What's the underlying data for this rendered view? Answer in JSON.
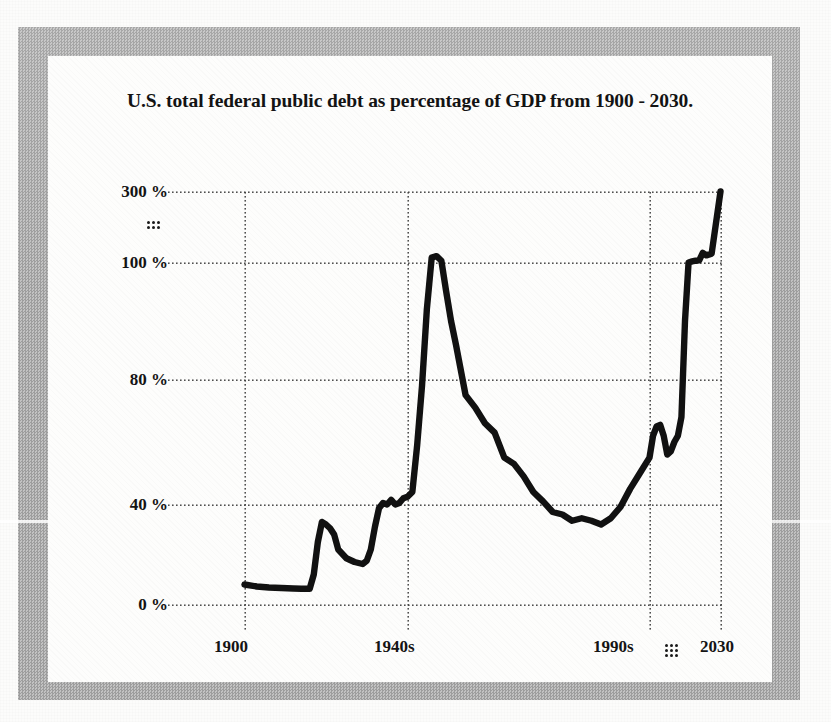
{
  "figure": {
    "title": "U.S. total federal public debt as percentage of GDP from 1900 - 2030.",
    "frame_color": "#a8a8a8",
    "panel_color": "#fdfdfc",
    "line_color": "#111111",
    "grid_color": "#4a4a4a"
  },
  "axes": {
    "y_ticks": [
      "300 %",
      "100 %",
      "80 %",
      "40 %",
      "0 %"
    ],
    "y_break_marker": "vertical-ellipsis-dots",
    "x_ticks": [
      "1900",
      "1940s",
      "1990s",
      "2030"
    ],
    "x_break_marker": "vertical-ellipsis-dots",
    "y_axis_note": "broken axis between 100 % and 300 %",
    "x_axis_note": "broken axis between 1990s and 2030"
  },
  "chart_data": {
    "type": "line",
    "title": "U.S. total federal public debt as percentage of GDP from 1900 - 2030.",
    "xlabel": "",
    "ylabel": "",
    "grid": true,
    "legend": null,
    "xlim": [
      1900,
      2030
    ],
    "ylim": [
      0,
      300
    ],
    "y_tick_values": [
      0,
      40,
      80,
      100,
      300
    ],
    "y_tick_labels": [
      "0 %",
      "40 %",
      "80 %",
      "100 %",
      "300 %"
    ],
    "x_tick_values": [
      1900,
      1940,
      1990,
      2030
    ],
    "x_tick_labels": [
      "1900",
      "1940s",
      "1990s",
      "2030"
    ],
    "axis_breaks": {
      "y_between": [
        100,
        300
      ],
      "x_between": [
        1990,
        2030
      ]
    },
    "series": [
      {
        "name": "Federal public debt (% of GDP)",
        "x": [
          1900,
          1903,
          1906,
          1909,
          1912,
          1914,
          1916,
          1917,
          1918,
          1919,
          1920,
          1921,
          1922,
          1923,
          1925,
          1927,
          1929,
          1930,
          1931,
          1932,
          1933,
          1934,
          1935,
          1936,
          1937,
          1938,
          1939,
          1940,
          1941,
          1942,
          1943,
          1944,
          1945,
          1946,
          1947,
          1948,
          1949,
          1950,
          1952,
          1954,
          1956,
          1958,
          1960,
          1962,
          1964,
          1966,
          1968,
          1970,
          1972,
          1974,
          1976,
          1978,
          1980,
          1982,
          1984,
          1986,
          1988,
          1990,
          1992,
          1994,
          1996,
          1998,
          2000,
          2002,
          2004,
          2006,
          2008,
          2010,
          2012,
          2014,
          2016,
          2018,
          2020,
          2022,
          2025,
          2030
        ],
        "y": [
          8.0,
          7.2,
          6.8,
          6.6,
          6.4,
          6.3,
          6.3,
          12.0,
          25.0,
          33.0,
          32.0,
          30.5,
          28.0,
          22.0,
          18.5,
          17.0,
          16.2,
          17.5,
          22.0,
          31.0,
          38.5,
          40.5,
          40.0,
          41.5,
          40.0,
          40.5,
          42.0,
          42.5,
          44.0,
          59.0,
          78.0,
          92.0,
          114.0,
          118.0,
          105.0,
          95.0,
          90.0,
          86.0,
          75.0,
          71.0,
          66.0,
          63.0,
          55.0,
          53.0,
          49.0,
          44.0,
          41.0,
          37.0,
          36.0,
          33.5,
          34.5,
          33.5,
          32.0,
          34.5,
          39.0,
          45.0,
          50.0,
          55.0,
          62.0,
          65.0,
          65.5,
          62.0,
          56.0,
          57.0,
          60.0,
          62.0,
          68.0,
          90.0,
          100.0,
          103.0,
          105.0,
          106.0,
          127.0,
          120.0,
          125.0,
          300.0
        ]
      }
    ],
    "annotations": [
      {
        "text": "300 %",
        "kind": "y-tick"
      },
      {
        "text": "100 %",
        "kind": "y-tick"
      },
      {
        "text": "80 %",
        "kind": "y-tick"
      },
      {
        "text": "40 %",
        "kind": "y-tick"
      },
      {
        "text": "0 %",
        "kind": "y-tick"
      },
      {
        "text": "1900",
        "kind": "x-tick"
      },
      {
        "text": "1940s",
        "kind": "x-tick"
      },
      {
        "text": "1990s",
        "kind": "x-tick"
      },
      {
        "text": "2030",
        "kind": "x-tick"
      }
    ]
  }
}
